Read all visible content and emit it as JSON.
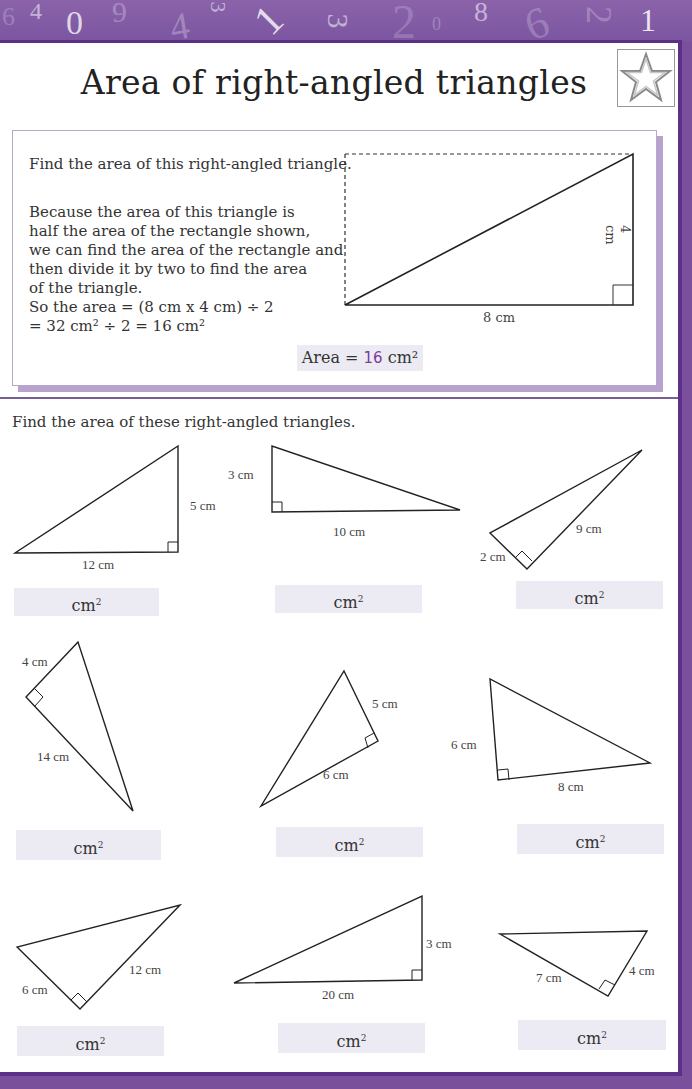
{
  "header": {
    "decorative_numbers": [
      "4",
      "0",
      "6",
      "4",
      "3",
      "1",
      "3",
      "2",
      "0",
      "8",
      "6",
      "2",
      "1"
    ]
  },
  "title": "Area of right-angled triangles",
  "star_icon": "star-outline-icon",
  "example": {
    "prompt": "Find the area of this right-angled triangle.",
    "explanation_lines": [
      "Because the area of this triangle is",
      "half the area of the rectangle shown,",
      "we can find the area of the rectangle and",
      "then divide it by two to find the area",
      "of the triangle.",
      "So the area = (8 cm x 4 cm) ÷ 2",
      "= 32 cm² ÷ 2 = 16 cm²"
    ],
    "diagram": {
      "base_label": "8 cm",
      "height_label": "4 cm"
    },
    "answer": {
      "prefix": "Area = ",
      "value": "16",
      "unit": "cm²"
    }
  },
  "exercise": {
    "instruction": "Find the area of these right-angled triangles.",
    "unit_label": "cm",
    "unit_sup": "2",
    "triangles": [
      {
        "labels": [
          "12 cm",
          "5 cm"
        ]
      },
      {
        "labels": [
          "3 cm",
          "10 cm"
        ]
      },
      {
        "labels": [
          "2 cm",
          "9 cm"
        ]
      },
      {
        "labels": [
          "4 cm",
          "14 cm"
        ]
      },
      {
        "labels": [
          "5 cm",
          "6 cm"
        ]
      },
      {
        "labels": [
          "6 cm",
          "8 cm"
        ]
      },
      {
        "labels": [
          "6 cm",
          "12 cm"
        ]
      },
      {
        "labels": [
          "3 cm",
          "20 cm"
        ]
      },
      {
        "labels": [
          "7 cm",
          "4 cm"
        ]
      }
    ]
  },
  "colors": {
    "purple_frame": "#5e2f86",
    "purple_band": "#7b55a0",
    "answer_chip_bg": "#ecebf3",
    "answer_value": "#7c3c9a"
  }
}
